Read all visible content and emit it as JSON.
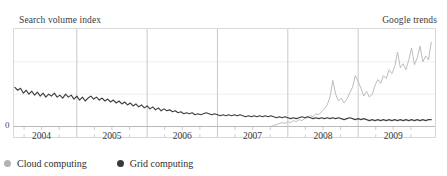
{
  "header": {
    "title": "Search volume index",
    "source": "Google trends"
  },
  "axis": {
    "y_zero_label": "0",
    "x_tick_labels": [
      "2004",
      "2005",
      "2006",
      "2007",
      "2008",
      "2009"
    ]
  },
  "legend": {
    "items": [
      {
        "label": "Cloud computing",
        "color": "#b3b3b3",
        "marker": "filled-circle-marker"
      },
      {
        "label": "Grid computing",
        "color": "#3a3a3a",
        "marker": "filled-circle-marker"
      }
    ]
  },
  "colors": {
    "cloud_line": "#b9b9b9",
    "grid_line": "#404040",
    "gridline": "#eeeeee",
    "axis": "#d8d8d8",
    "tick": "#cccccc",
    "text": "#3b3b3b",
    "background": "#ffffff"
  },
  "chart_data": {
    "type": "line",
    "title": "Search volume index",
    "subtitle": "Google trends",
    "xlabel": "",
    "ylabel": "Search volume index",
    "grid": true,
    "legend_position": "bottom-left",
    "xlim": [
      2003.6,
      2009.6
    ],
    "ylim": [
      0,
      100
    ],
    "yticks": [
      0
    ],
    "ytick_labels": [
      "0"
    ],
    "y_gridlines": [
      33,
      66
    ],
    "xticks": [
      2004,
      2005,
      2006,
      2007,
      2008,
      2009
    ],
    "xtick_labels": [
      "2004",
      "2005",
      "2006",
      "2007",
      "2008",
      "2009"
    ],
    "x_minor_tick_interval": 0.25,
    "note": "Weekly Google Trends search volume index; 'Grid computing' declines steadily from 2004, 'Cloud computing' is near zero until mid-2007 then rises sharply through 2009 with weekly spikes.",
    "series": [
      {
        "name": "Grid computing",
        "color": "#404040",
        "x": [
          2003.62,
          2003.66,
          2003.7,
          2003.74,
          2003.78,
          2003.82,
          2003.86,
          2003.9,
          2003.94,
          2003.98,
          2004.02,
          2004.06,
          2004.1,
          2004.14,
          2004.18,
          2004.22,
          2004.26,
          2004.3,
          2004.34,
          2004.38,
          2004.42,
          2004.46,
          2004.5,
          2004.54,
          2004.58,
          2004.62,
          2004.66,
          2004.7,
          2004.74,
          2004.78,
          2004.82,
          2004.86,
          2004.9,
          2004.94,
          2004.98,
          2005.02,
          2005.06,
          2005.1,
          2005.14,
          2005.18,
          2005.22,
          2005.26,
          2005.3,
          2005.34,
          2005.38,
          2005.42,
          2005.46,
          2005.5,
          2005.54,
          2005.58,
          2005.62,
          2005.66,
          2005.7,
          2005.74,
          2005.78,
          2005.82,
          2005.86,
          2005.9,
          2005.94,
          2005.98,
          2006.02,
          2006.06,
          2006.1,
          2006.14,
          2006.18,
          2006.22,
          2006.26,
          2006.3,
          2006.34,
          2006.38,
          2006.42,
          2006.46,
          2006.5,
          2006.54,
          2006.58,
          2006.62,
          2006.66,
          2006.7,
          2006.74,
          2006.78,
          2006.82,
          2006.86,
          2006.9,
          2006.94,
          2006.98,
          2007.02,
          2007.06,
          2007.1,
          2007.14,
          2007.18,
          2007.22,
          2007.26,
          2007.3,
          2007.34,
          2007.38,
          2007.42,
          2007.46,
          2007.5,
          2007.54,
          2007.58,
          2007.62,
          2007.66,
          2007.7,
          2007.74,
          2007.78,
          2007.82,
          2007.86,
          2007.9,
          2007.94,
          2007.98,
          2008.02,
          2008.06,
          2008.1,
          2008.14,
          2008.18,
          2008.22,
          2008.26,
          2008.3,
          2008.34,
          2008.38,
          2008.42,
          2008.46,
          2008.5,
          2008.54,
          2008.58,
          2008.62,
          2008.66,
          2008.7,
          2008.74,
          2008.78,
          2008.82,
          2008.86,
          2008.9,
          2008.94,
          2008.98,
          2009.02,
          2009.06,
          2009.1,
          2009.14,
          2009.18,
          2009.22,
          2009.26,
          2009.3,
          2009.34,
          2009.38,
          2009.42,
          2009.46,
          2009.5,
          2009.54
        ],
        "y": [
          40,
          37,
          39,
          34,
          37,
          33,
          36,
          32,
          35,
          31,
          34,
          30,
          33,
          31,
          34,
          30,
          32,
          29,
          33,
          30,
          32,
          28,
          31,
          27,
          30,
          26,
          29,
          31,
          28,
          30,
          27,
          29,
          26,
          28,
          25,
          27,
          24,
          26,
          23,
          25,
          22,
          24,
          21,
          23,
          20,
          22,
          19,
          21,
          18,
          20,
          17,
          19,
          16,
          18,
          16,
          17,
          15,
          16,
          14,
          15,
          13,
          14,
          13,
          14,
          12,
          13,
          12,
          13,
          14,
          13,
          12,
          13,
          12,
          11,
          12,
          11,
          12,
          11,
          12,
          11,
          12,
          11,
          10,
          11,
          10,
          11,
          10,
          11,
          10,
          11,
          10,
          11,
          10,
          9,
          10,
          9,
          10,
          9,
          8,
          9,
          8,
          9,
          10,
          9,
          10,
          9,
          8,
          9,
          8,
          9,
          8,
          9,
          8,
          9,
          8,
          9,
          8,
          7,
          8,
          9,
          8,
          7,
          8,
          7,
          8,
          7,
          6,
          7,
          6,
          7,
          6,
          7,
          6,
          7,
          6,
          7,
          6,
          7,
          6,
          7,
          6,
          7,
          6,
          7,
          6,
          7,
          6,
          7,
          7
        ]
      },
      {
        "name": "Cloud computing",
        "color": "#b9b9b9",
        "x": [
          2007.26,
          2007.3,
          2007.34,
          2007.38,
          2007.42,
          2007.46,
          2007.5,
          2007.54,
          2007.58,
          2007.62,
          2007.66,
          2007.7,
          2007.74,
          2007.78,
          2007.82,
          2007.86,
          2007.9,
          2007.94,
          2007.98,
          2008.02,
          2008.06,
          2008.1,
          2008.14,
          2008.18,
          2008.22,
          2008.26,
          2008.3,
          2008.34,
          2008.38,
          2008.42,
          2008.46,
          2008.5,
          2008.54,
          2008.58,
          2008.62,
          2008.66,
          2008.7,
          2008.74,
          2008.78,
          2008.82,
          2008.86,
          2008.9,
          2008.94,
          2008.98,
          2009.02,
          2009.06,
          2009.1,
          2009.14,
          2009.18,
          2009.22,
          2009.26,
          2009.3,
          2009.34,
          2009.38,
          2009.42,
          2009.46,
          2009.5,
          2009.54
        ],
        "y": [
          0,
          1,
          2,
          3,
          4,
          3,
          5,
          4,
          6,
          5,
          7,
          6,
          8,
          9,
          11,
          10,
          13,
          12,
          15,
          18,
          22,
          30,
          47,
          33,
          26,
          29,
          24,
          28,
          34,
          40,
          52,
          46,
          39,
          31,
          36,
          30,
          33,
          42,
          48,
          44,
          52,
          49,
          58,
          54,
          61,
          76,
          60,
          64,
          58,
          68,
          80,
          63,
          70,
          82,
          66,
          72,
          68,
          86
        ]
      }
    ]
  }
}
